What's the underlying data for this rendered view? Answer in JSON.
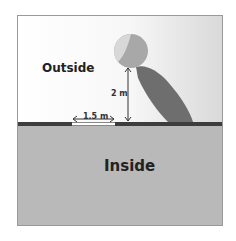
{
  "diagram": {
    "labels": {
      "outside": "Outside",
      "inside": "Inside"
    },
    "dimensions": {
      "opening_width": "1.5 m",
      "ball_height": "2 m"
    },
    "colors": {
      "sky_left": "#ffffff",
      "sky_right": "#d9d9d9",
      "ground": "#b9b9b9",
      "wall": "#3d3d3d",
      "ball_shadow": "#6e6e6e",
      "ball": "#a8a8a8"
    }
  }
}
